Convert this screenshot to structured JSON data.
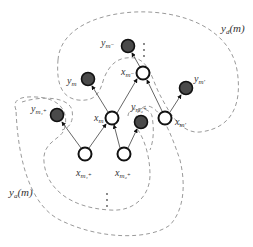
{
  "diagram": {
    "title": "",
    "region_labels": {
      "descendants": "y",
      "descendants_sub": "d",
      "descendants_arg": "(m)",
      "ancestors": "y",
      "ancestors_sub": "a",
      "ancestors_arg": "(m)"
    },
    "nodes": [
      {
        "id": "y_m_minus",
        "type": "observed",
        "label": "y",
        "sub": "m⁻"
      },
      {
        "id": "x_m_minus",
        "type": "latent",
        "label": "x",
        "sub": "m⁻"
      },
      {
        "id": "y_m",
        "type": "observed",
        "label": "y",
        "sub": "m"
      },
      {
        "id": "y_m_prime",
        "type": "observed",
        "label": "y",
        "sub": "m′"
      },
      {
        "id": "x_m",
        "type": "latent",
        "label": "x",
        "sub": "m"
      },
      {
        "id": "x_m_prime",
        "type": "latent",
        "label": "x",
        "sub": "m′"
      },
      {
        "id": "y_m1_plus",
        "type": "observed",
        "label": "y",
        "sub": "m₁⁺"
      },
      {
        "id": "y_m2_plus",
        "type": "observed",
        "label": "y",
        "sub": "m₂⁺"
      },
      {
        "id": "x_m1_plus",
        "type": "latent",
        "label": "x",
        "sub": "m₁⁺"
      },
      {
        "id": "x_m2_plus",
        "type": "latent",
        "label": "x",
        "sub": "m₂⁺"
      }
    ],
    "edges": [
      {
        "from": "x_m_minus",
        "to": "y_m_minus"
      },
      {
        "from": "x_m",
        "to": "y_m"
      },
      {
        "from": "x_m",
        "to": "x_m_minus"
      },
      {
        "from": "x_m_prime",
        "to": "x_m_minus"
      },
      {
        "from": "x_m_prime",
        "to": "y_m_prime"
      },
      {
        "from": "x_m1_plus",
        "to": "y_m1_plus"
      },
      {
        "from": "x_m1_plus",
        "to": "x_m"
      },
      {
        "from": "x_m2_plus",
        "to": "x_m"
      },
      {
        "from": "x_m2_plus",
        "to": "y_m2_plus"
      }
    ],
    "ellipsis": "⋮"
  }
}
